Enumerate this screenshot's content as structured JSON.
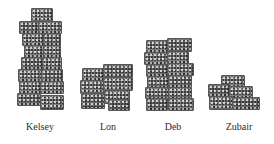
{
  "figure": {
    "stacks": [
      {
        "name": "Kelsey",
        "cube_rows": 8
      },
      {
        "name": "Lon",
        "cube_rows": 4
      },
      {
        "name": "Deb",
        "cube_rows": 6
      },
      {
        "name": "Zubair",
        "cube_rows": 3
      }
    ]
  },
  "colors": {
    "background": "#ffffff",
    "cube": "#7d7d7d",
    "label_text": "#2b2b2b"
  }
}
